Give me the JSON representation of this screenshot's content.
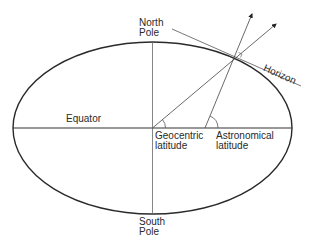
{
  "diagram": {
    "labels": {
      "north_pole": [
        "North",
        "Pole"
      ],
      "south_pole": [
        "South",
        "Pole"
      ],
      "equator": "Equator",
      "horizon": "Horizon",
      "geocentric_latitude": [
        "Geocentric",
        "latitude"
      ],
      "astronomical_latitude": [
        "Astronomical",
        "latitude"
      ]
    },
    "colors": {
      "ellipse": "#2a2a2a",
      "lines": "#444444",
      "text": "#2a2a2a",
      "background": "#ffffff"
    }
  }
}
